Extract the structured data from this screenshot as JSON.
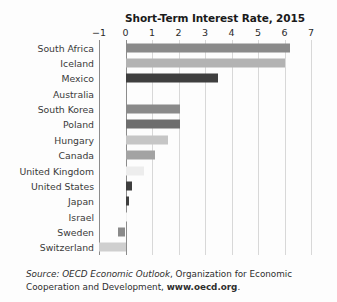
{
  "chart_data": {
    "type": "bar",
    "orientation": "horizontal",
    "title": "Short-Term Interest Rate, 2015",
    "xlabel": "",
    "ylabel": "",
    "xlim": [
      -1,
      7
    ],
    "xticks": [
      "−1",
      "0",
      "1",
      "2",
      "3",
      "4",
      "5",
      "6",
      "7"
    ],
    "xtick_values": [
      -1,
      0,
      1,
      2,
      3,
      4,
      5,
      6,
      7
    ],
    "grid": true,
    "legend": "none",
    "categories": [
      "South Africa",
      "Iceland",
      "Mexico",
      "Australia",
      "South Korea",
      "Poland",
      "Hungary",
      "Canada",
      "United Kingdom",
      "United States",
      "Japan",
      "Israel",
      "Sweden",
      "Switzerland"
    ],
    "values": [
      6.2,
      6.0,
      3.5,
      0.0,
      2.05,
      2.05,
      1.6,
      1.1,
      0.7,
      0.25,
      0.15,
      0.05,
      -0.3,
      -1.0
    ],
    "bar_colors": [
      "#8a8a8a",
      "#b3b3b3",
      "#3f3f3f",
      "#f2f2f2",
      "#8a8a8a",
      "#6e6e6e",
      "#c6c6c6",
      "#a3a3a3",
      "#ededed",
      "#3f3f3f",
      "#3f3f3f",
      "#f2f2f2",
      "#8a8a8a",
      "#cfcfcf"
    ]
  },
  "source_note": {
    "prefix": "Source:",
    "italic_title": "OECD Economic Outlook",
    "middle": ", Organization for Economic Cooperation and Development, ",
    "bold_url": "www.oecd.org",
    "suffix": "."
  },
  "colors": {
    "axis": "#8c8c8c",
    "gridline": "#d8d8d8",
    "text": "#2b2b2b",
    "background": "#fdfdfd"
  }
}
